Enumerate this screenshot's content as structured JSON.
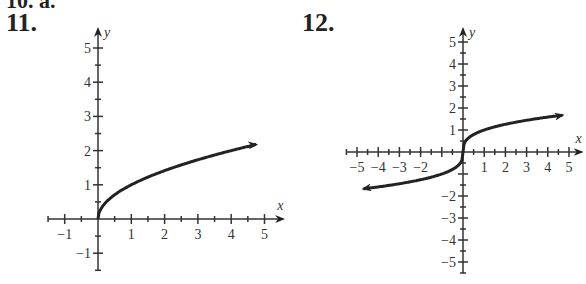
{
  "header": {
    "partial_label": "10. a.",
    "problem_11": "11.",
    "problem_12": "12."
  },
  "chart_data": [
    {
      "type": "line",
      "title": "11.",
      "function_shape": "square root curve starting at origin",
      "xlabel": "x",
      "ylabel": "y",
      "xlim": [
        -1.5,
        5.5
      ],
      "ylim": [
        -1.5,
        5.5
      ],
      "x_ticks": [
        -1,
        1,
        2,
        3,
        4,
        5
      ],
      "y_ticks": [
        -1,
        1,
        2,
        3,
        4,
        5
      ],
      "minor_ticks": 0.5,
      "series": [
        {
          "name": "y = sqrt(x)",
          "x": [
            0,
            0.25,
            1,
            2,
            3,
            4,
            4.75
          ],
          "y": [
            0,
            0.5,
            1,
            1.41,
            1.73,
            2,
            2.18
          ],
          "arrow_end": true
        }
      ]
    },
    {
      "type": "line",
      "title": "12.",
      "function_shape": "cube root curve through origin",
      "xlabel": "x",
      "ylabel": "y",
      "xlim": [
        -5.5,
        5.5
      ],
      "ylim": [
        -5.5,
        5.5
      ],
      "x_ticks": [
        -5,
        -4,
        -3,
        -2,
        1,
        2,
        3,
        4,
        5
      ],
      "y_ticks": [
        -5,
        -4,
        -3,
        -2,
        1,
        2,
        3,
        4,
        5
      ],
      "minor_ticks": 0.5,
      "series": [
        {
          "name": "y = cbrt(x)",
          "x": [
            -4.7,
            -3,
            -1,
            0,
            1,
            3,
            4.7
          ],
          "y": [
            -1.67,
            -1.44,
            -1,
            0,
            1,
            1.44,
            1.67
          ],
          "arrow_start": true,
          "arrow_end": true
        }
      ]
    }
  ]
}
